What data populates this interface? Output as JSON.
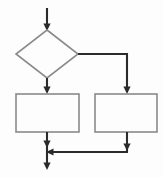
{
  "diagram": {
    "type": "flowchart",
    "background_color": "#fdfdfd",
    "shape_stroke_color": "#8a8a8a",
    "connector_color": "#2b2b2b",
    "nodes": [
      {
        "id": "decision",
        "shape": "diamond",
        "label": "",
        "center_x": 47,
        "center_y": 54,
        "half_width": 31,
        "half_height": 24
      },
      {
        "id": "process-left",
        "shape": "rectangle",
        "label": "",
        "x": 16,
        "y": 94,
        "width": 63,
        "height": 38
      },
      {
        "id": "process-right",
        "shape": "rectangle",
        "label": "",
        "x": 95,
        "y": 94,
        "width": 62,
        "height": 38
      }
    ],
    "connectors": [
      {
        "id": "entry-arrow",
        "from": "start",
        "to": "decision",
        "label": "",
        "path": "M 47 8 L 47 29",
        "arrow_at": {
          "x": 47,
          "y": 30
        },
        "arrow_dir": "down"
      },
      {
        "id": "decision-to-left",
        "from": "decision",
        "to": "process-left",
        "label": "",
        "path": "M 47 78 L 47 92",
        "arrow_at": {
          "x": 47,
          "y": 93
        },
        "arrow_dir": "down"
      },
      {
        "id": "decision-to-right",
        "from": "decision",
        "to": "process-right",
        "label": "",
        "path": "M 78 54 L 127 54 L 127 92",
        "arrow_at": {
          "x": 127,
          "y": 93
        },
        "arrow_dir": "down"
      },
      {
        "id": "left-to-merge",
        "from": "process-left",
        "to": "merge",
        "label": "",
        "path": "M 47 132 L 47 151",
        "arrow_at": {
          "x": 47,
          "y": 147
        },
        "arrow_dir": "down"
      },
      {
        "id": "right-to-merge",
        "from": "process-right",
        "to": "merge",
        "label": "",
        "path": "M 127 132 L 127 152",
        "arrow_at": {
          "x": 127,
          "y": 150
        },
        "arrow_dir": "down"
      },
      {
        "id": "merge-bar",
        "from": "merge",
        "to": "merge",
        "label": "",
        "path": "M 127 152 L 47 152",
        "arrow_at": {
          "x": 48,
          "y": 152
        },
        "arrow_dir": "left"
      },
      {
        "id": "exit-arrow",
        "from": "merge",
        "to": "end",
        "label": "",
        "path": "M 47 152 L 47 168",
        "arrow_at": {
          "x": 47,
          "y": 170
        },
        "arrow_dir": "down"
      }
    ]
  }
}
